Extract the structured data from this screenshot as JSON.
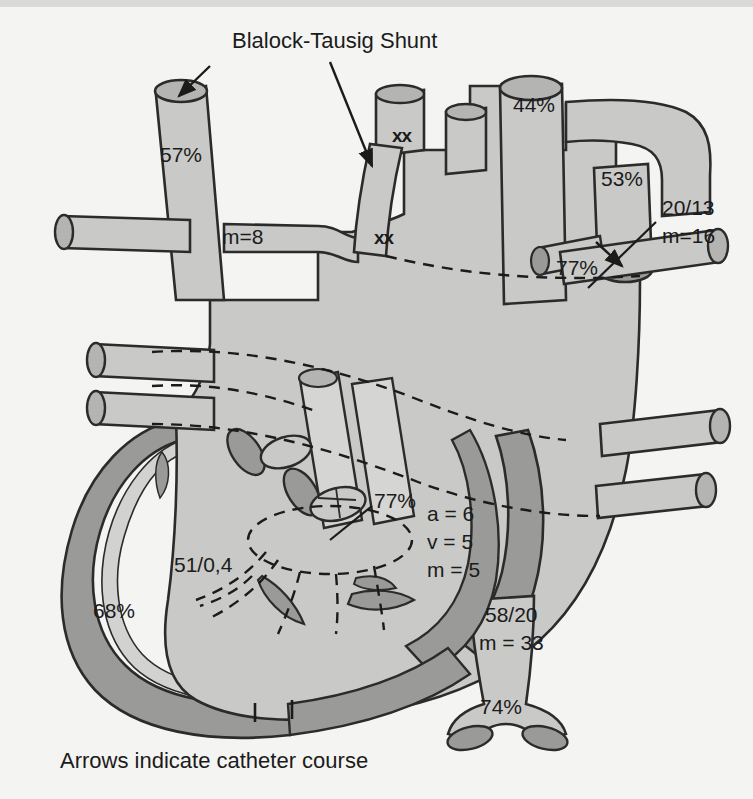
{
  "figure": {
    "title": "Blalock-Tausig Shunt",
    "caption": "Arrows indicate catheter course",
    "background_color": "#f4f4f2",
    "vessel_fill": "#c9c9c7",
    "vessel_fill_light": "#d5d5d3",
    "wall_fill": "#9a9a98",
    "lumen_fill": "#b4b4b2",
    "outline_color": "#2b2b2b",
    "text_color": "#1b1b1b"
  },
  "annotations": {
    "svc_saturation": "57%",
    "svc_mean_pressure": "m=8",
    "aorta_saturation": "44%",
    "pulmonary_artery_saturation": "53%",
    "pulmonary_artery_pressure_systolic_diastolic": "20/13",
    "pulmonary_artery_mean": "m=16",
    "pulmonary_vein_saturation": "77%",
    "left_atrium_saturation": "77%",
    "left_atrium_a_wave": "a = 6",
    "left_atrium_v_wave": "v = 5",
    "left_atrium_mean": "m = 5",
    "left_ventricle_pressure": "51/0,4",
    "left_ventricle_saturation": "68%",
    "descending_aorta_pressure": "58/20",
    "descending_aorta_mean": "m = 33",
    "ivc_saturation": "74%",
    "suture_marker_upper": "xx",
    "suture_marker_lower": "xx"
  },
  "labels": [
    {
      "name": "svc-saturation",
      "text": "57%",
      "x": 160,
      "y": 162,
      "size": 21,
      "anchor": "start"
    },
    {
      "name": "svc-mean-pressure",
      "text": "m=8",
      "x": 222,
      "y": 244,
      "size": 21,
      "anchor": "start"
    },
    {
      "name": "aorta-saturation",
      "text": "44%",
      "x": 513,
      "y": 112,
      "size": 21,
      "anchor": "start"
    },
    {
      "name": "pa-saturation",
      "text": "53%",
      "x": 601,
      "y": 186,
      "size": 21,
      "anchor": "start"
    },
    {
      "name": "pa-pressure",
      "text": "20/13",
      "x": 662,
      "y": 215,
      "size": 21,
      "anchor": "start"
    },
    {
      "name": "pa-mean-pressure",
      "text": "m=16",
      "x": 662,
      "y": 243,
      "size": 21,
      "anchor": "start"
    },
    {
      "name": "pulmonary-vein-sat",
      "text": "77%",
      "x": 556,
      "y": 275,
      "size": 21,
      "anchor": "start"
    },
    {
      "name": "left-atrium-sat",
      "text": "77%",
      "x": 374,
      "y": 508,
      "size": 21,
      "anchor": "start"
    },
    {
      "name": "la-a-wave",
      "text": "a = 6",
      "x": 427,
      "y": 521,
      "size": 21,
      "anchor": "start"
    },
    {
      "name": "la-v-wave",
      "text": "v = 5",
      "x": 427,
      "y": 549,
      "size": 21,
      "anchor": "start"
    },
    {
      "name": "la-mean",
      "text": "m = 5",
      "x": 427,
      "y": 577,
      "size": 21,
      "anchor": "start"
    },
    {
      "name": "lv-pressure",
      "text": "51/0,4",
      "x": 174,
      "y": 572,
      "size": 21,
      "anchor": "start"
    },
    {
      "name": "lv-saturation",
      "text": "68%",
      "x": 93,
      "y": 618,
      "size": 21,
      "anchor": "start"
    },
    {
      "name": "desc-aorta-pressure",
      "text": "58/20",
      "x": 485,
      "y": 622,
      "size": 21,
      "anchor": "start"
    },
    {
      "name": "desc-aorta-mean",
      "text": "m = 33",
      "x": 479,
      "y": 650,
      "size": 21,
      "anchor": "start"
    },
    {
      "name": "ivc-saturation",
      "text": "74%",
      "x": 480,
      "y": 714,
      "size": 21,
      "anchor": "start"
    }
  ],
  "suture_markers": [
    {
      "name": "suture-upper",
      "text": "xx",
      "x": 392,
      "y": 142,
      "size": 19
    },
    {
      "name": "suture-lower",
      "text": "xx",
      "x": 374,
      "y": 244,
      "size": 19
    }
  ]
}
